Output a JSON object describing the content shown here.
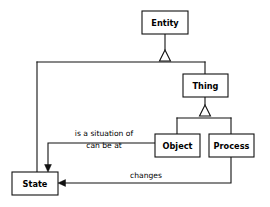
{
  "diagram": {
    "type": "uml-class-diagram",
    "background_color": "#ffffff",
    "line_color": "#111111",
    "box_fill_color": "#ffffff",
    "nodes": [
      {
        "id": "entity",
        "label": "Entity",
        "x": 142,
        "y": 11,
        "w": 46,
        "h": 23
      },
      {
        "id": "thing",
        "label": "Thing",
        "x": 183,
        "y": 74,
        "w": 45,
        "h": 23
      },
      {
        "id": "object",
        "label": "Object",
        "x": 155,
        "y": 134,
        "w": 45,
        "h": 23
      },
      {
        "id": "process",
        "label": "Process",
        "x": 209,
        "y": 134,
        "w": 45,
        "h": 23
      },
      {
        "id": "state",
        "label": "State",
        "x": 12,
        "y": 172,
        "w": 46,
        "h": 23
      }
    ],
    "generalizations": [
      {
        "id": "entity-gen",
        "parent": "entity",
        "children": [
          "state",
          "thing"
        ]
      },
      {
        "id": "thing-gen",
        "parent": "thing",
        "children": [
          "object",
          "process"
        ]
      }
    ],
    "associations": [
      {
        "id": "object-to-state",
        "from": "object",
        "to": "state",
        "labels": [
          "is a situation of",
          "can be at"
        ],
        "arrow": "open-to-target"
      },
      {
        "id": "process-to-state",
        "from": "process",
        "to": "state",
        "labels": [
          "changes"
        ],
        "arrow": "open-to-target"
      }
    ],
    "labels": {
      "is_a_situation_of": "is a situation of",
      "can_be_at": "can be at",
      "changes": "changes"
    }
  }
}
